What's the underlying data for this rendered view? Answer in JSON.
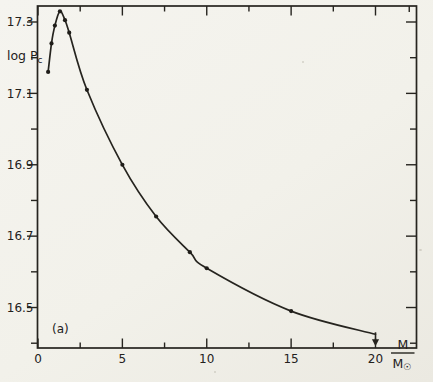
{
  "figure": {
    "panel_label": "(a)",
    "y_axis_label": {
      "main": "log P",
      "sub": "c"
    },
    "x_axis_label": {
      "numerator": "M",
      "denominator": "M",
      "denominator_sub": "☉"
    }
  },
  "chart_data": {
    "type": "line",
    "title": "",
    "xlabel": "M/M☉",
    "ylabel": "log Pc",
    "series": [
      {
        "name": "central pressure vs stellar mass",
        "x": [
          0.6,
          0.8,
          1.0,
          1.3,
          1.6,
          1.85,
          2.9,
          5,
          7,
          9,
          10,
          15,
          20
        ],
        "y": [
          17.16,
          17.24,
          17.29,
          17.33,
          17.305,
          17.27,
          17.11,
          16.9,
          16.755,
          16.655,
          16.61,
          16.49,
          16.425
        ]
      }
    ],
    "marker": "filled-dot",
    "end_marker": "down-arrow-at-x-20",
    "xlim": [
      0,
      22.4
    ],
    "ylim": [
      16.39,
      17.35
    ],
    "x_major_ticks": [
      0,
      5,
      10,
      15,
      20
    ],
    "x_major_tick_labels": [
      "0",
      "5",
      "10",
      "15",
      "20"
    ],
    "x_minor_ticks": [
      2.5,
      7.5,
      12.5,
      17.5
    ],
    "x_top_extra_minor_tick": 22,
    "y_major_ticks": [
      17.3,
      17.1,
      16.9,
      16.7,
      16.5
    ],
    "y_major_tick_labels": [
      "17.3",
      "17.1",
      "16.9",
      "16.7",
      "16.5"
    ],
    "y_minor_ticks": [
      17.2,
      17.0,
      16.8,
      16.6,
      16.4
    ],
    "grid": false,
    "legend": false,
    "line_color": "#26241f",
    "paper_color": "#f3f2ec"
  }
}
